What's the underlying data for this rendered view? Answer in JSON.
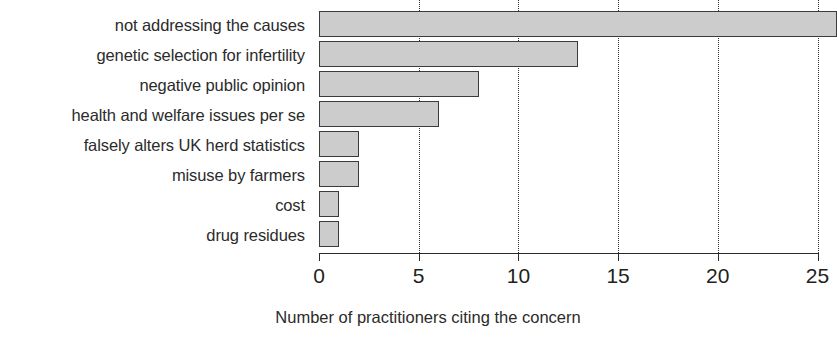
{
  "chart_data": {
    "type": "bar",
    "orientation": "horizontal",
    "title": "",
    "xlabel": "Number of practitioners citing the concern",
    "ylabel": "",
    "categories": [
      "not addressing the causes",
      "genetic selection for infertility",
      "negative public opinion",
      "health and welfare issues per se",
      "falsely alters UK herd statistics",
      "misuse by farmers",
      "cost",
      "drug residues"
    ],
    "values": [
      26,
      13,
      8,
      6,
      2,
      2,
      1,
      1
    ],
    "xlim": [
      0,
      25
    ],
    "xticks": [
      0,
      5,
      10,
      15,
      20,
      25
    ],
    "xtick_labels": [
      "0",
      "5",
      "10",
      "15",
      "20",
      "25"
    ],
    "grid": "vertical-dotted",
    "legend": null,
    "bar_fill_color": "#cccccc",
    "bar_border_color": "#3b3b3b",
    "axis_color": "#2b2b2b",
    "note": "top bar extends past the right edge of the plotted axis (clipped)"
  }
}
